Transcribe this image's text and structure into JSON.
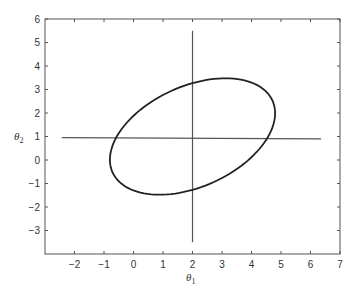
{
  "chart_data": {
    "type": "line",
    "title": "",
    "xlabel": "θ1",
    "ylabel": "θ2",
    "xlim": [
      -3,
      7
    ],
    "ylim": [
      -4,
      6
    ],
    "xticks": [
      -2,
      -1,
      0,
      1,
      2,
      3,
      4,
      5,
      6,
      7
    ],
    "yticks": [
      -3,
      -2,
      -1,
      0,
      1,
      2,
      3,
      4,
      5,
      6
    ],
    "grid": false,
    "legend": null,
    "series": [
      {
        "name": "horizontal-line",
        "x": [
          -2.43,
          6.36
        ],
        "y": [
          0.95,
          0.9
        ]
      },
      {
        "name": "vertical-line",
        "x": [
          2.0,
          2.0
        ],
        "y": [
          -3.5,
          5.5
        ]
      },
      {
        "name": "ellipse",
        "center": [
          2.0,
          1.0
        ],
        "param": {
          "A": 2.8,
          "B": 0.0,
          "C": 0.99,
          "D": 2.27
        },
        "extremes": {
          "top": [
            3.16,
            3.48
          ],
          "bottom": [
            0.8,
            -1.48
          ],
          "left": [
            -0.8,
            0.14
          ],
          "right": [
            4.77,
            1.99
          ]
        }
      }
    ]
  },
  "labels": {
    "xlabel_main": "θ",
    "xlabel_sub": "1",
    "ylabel_main": "θ",
    "ylabel_sub": "2"
  }
}
